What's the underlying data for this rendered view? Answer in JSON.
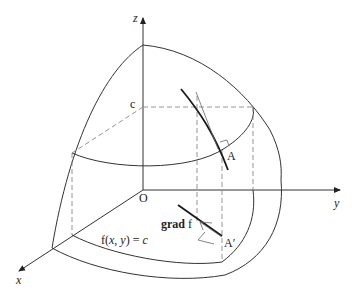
{
  "figure": {
    "type": "3d-surface-gradient-diagram",
    "labels": {
      "z_axis": "z",
      "y_axis": "y",
      "x_axis": "x",
      "origin": "O",
      "level": "c",
      "point_a": "A",
      "point_a_prime": "A′",
      "grad_bold": "grad",
      "grad_f": " f",
      "level_curve_f": "f(",
      "level_curve_x": "x",
      "level_curve_sep": ", ",
      "level_curve_y": "y",
      "level_curve_eq": ") = ",
      "level_curve_c": "c"
    },
    "colors": {
      "line": "#333333",
      "dashed": "#888888",
      "background": "#ffffff"
    }
  }
}
